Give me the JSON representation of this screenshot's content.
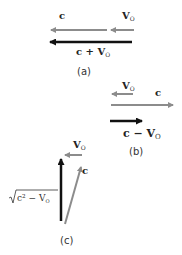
{
  "diagram": {
    "colors": {
      "gray": "#8c8c8c",
      "black": "#111111"
    },
    "panel_a": {
      "caption": "(a)",
      "label_c": "c",
      "label_v": "V",
      "label_v_sub": "O",
      "result_c": "c + V",
      "result_sub": "O"
    },
    "panel_b": {
      "caption": "(b)",
      "label_c": "c",
      "label_v": "V",
      "label_v_sub": "O",
      "result_c": "c − V",
      "result_sub": "O"
    },
    "panel_c": {
      "caption": "(c)",
      "label_c": "c",
      "label_v": "V",
      "label_v_sub": "O",
      "sqrt_expr": "c² − V",
      "sqrt_sub": "O",
      "sqrt_sup": "2"
    }
  }
}
